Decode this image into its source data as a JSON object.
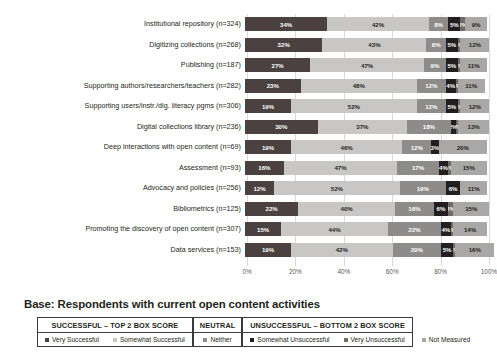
{
  "base_note": "Base: Respondents with current open content activities",
  "colors": {
    "very_successful": "#4a4140",
    "somewhat_successful": "#c8c7c5",
    "neither": "#8d8c8a",
    "somewhat_unsuccessful": "#231f20",
    "very_unsuccessful": "#6e6c6a",
    "not_measured": "#a9a8a6"
  },
  "legend": {
    "groups": [
      {
        "header": "SUCCESSFUL – TOP 2 BOX SCORE",
        "items": [
          {
            "label": "Very Successful",
            "color": "#4a4140"
          },
          {
            "label": "Somewhat Successful",
            "color": "#c8c7c5"
          }
        ]
      },
      {
        "header": "NEUTRAL",
        "items": [
          {
            "label": "Neither",
            "color": "#8d8c8a"
          }
        ]
      },
      {
        "header": "UNSUCCESSFUL – BOTTOM 2 BOX SCORE",
        "items": [
          {
            "label": "Somewhat Unsuccessful",
            "color": "#231f20"
          },
          {
            "label": "Very Unsuccessful",
            "color": "#6e6c6a"
          }
        ]
      }
    ],
    "loose": {
      "label": "Not Measured",
      "color": "#a9a8a6"
    }
  },
  "chart_data": {
    "type": "bar",
    "orientation": "horizontal",
    "stacked": true,
    "stack_total": 100,
    "title": "",
    "xlabel": "",
    "ylabel": "",
    "xlim": [
      0,
      100
    ],
    "xticks": [
      "0%",
      "20%",
      "40%",
      "60%",
      "80%",
      "100%"
    ],
    "xtick_values": [
      0,
      20,
      40,
      60,
      80,
      100
    ],
    "grid": true,
    "legend_position": "bottom",
    "series": [
      {
        "name": "Very Successful",
        "color": "#4a4140",
        "values": [
          34,
          32,
          27,
          23,
          19,
          30,
          19,
          16,
          12,
          22,
          15,
          19
        ]
      },
      {
        "name": "Somewhat Successful",
        "color": "#c8c7c5",
        "values": [
          42,
          43,
          47,
          48,
          52,
          37,
          46,
          47,
          52,
          40,
          44,
          42
        ]
      },
      {
        "name": "Neither",
        "color": "#8d8c8a",
        "values": [
          8,
          8,
          9,
          12,
          12,
          18,
          12,
          17,
          19,
          16,
          22,
          20
        ]
      },
      {
        "name": "Somewhat Unsuccessful",
        "color": "#231f20",
        "values": [
          5,
          5,
          5,
          4,
          5,
          2,
          3,
          4,
          6,
          6,
          4,
          5
        ]
      },
      {
        "name": "Very Unsuccessful",
        "color": "#6e6c6a",
        "values": [
          2,
          1,
          1,
          1,
          1,
          1,
          0,
          1,
          0,
          2,
          1,
          1
        ]
      },
      {
        "name": "Not Measured",
        "color": "#a9a8a6",
        "values": [
          9,
          12,
          11,
          11,
          12,
          13,
          20,
          15,
          11,
          15,
          14,
          16
        ]
      }
    ],
    "categories": [
      "Institutional repository (n=324)",
      "Digitizing collections (n=268)",
      "Publishing (n=187)",
      "Supporting authors/researchers/teachers (n=282)",
      "Supporting users/instr./dig. literacy pgms (n=306)",
      "Digital collections library (n=236)",
      "Deep interactions with open content (n=69)",
      "Assessment (n=93)",
      "Advocacy and policies (n=256)",
      "Bibliometrics (n=125)",
      "Promoting the discovery of open content (n=307)",
      "Data services (n=153)"
    ],
    "rows": [
      {
        "label": "Institutional repository (n=324)",
        "segments": [
          {
            "key": "very_successful",
            "label": "34%",
            "value": 34
          },
          {
            "key": "somewhat_successful",
            "label": "42%",
            "value": 42
          },
          {
            "key": "neither",
            "label": "8%",
            "value": 8
          },
          {
            "key": "somewhat_unsuccessful",
            "label": "5%",
            "value": 5
          },
          {
            "key": "very_unsuccessful",
            "label": "2%",
            "value": 2
          },
          {
            "key": "not_measured",
            "label": "9%",
            "value": 9
          }
        ]
      },
      {
        "label": "Digitizing collections (n=268)",
        "segments": [
          {
            "key": "very_successful",
            "label": "32%",
            "value": 32
          },
          {
            "key": "somewhat_successful",
            "label": "43%",
            "value": 43
          },
          {
            "key": "neither",
            "label": "8%",
            "value": 8
          },
          {
            "key": "somewhat_unsuccessful",
            "label": "5%",
            "value": 5
          },
          {
            "key": "very_unsuccessful",
            "label": "1%",
            "value": 1
          },
          {
            "key": "not_measured",
            "label": "12%",
            "value": 12
          }
        ]
      },
      {
        "label": "Publishing (n=187)",
        "segments": [
          {
            "key": "very_successful",
            "label": "27%",
            "value": 27
          },
          {
            "key": "somewhat_successful",
            "label": "47%",
            "value": 47
          },
          {
            "key": "neither",
            "label": "9%",
            "value": 9
          },
          {
            "key": "somewhat_unsuccessful",
            "label": "5%",
            "value": 5
          },
          {
            "key": "very_unsuccessful",
            "label": "1%",
            "value": 1
          },
          {
            "key": "not_measured",
            "label": "11%",
            "value": 11
          }
        ]
      },
      {
        "label": "Supporting authors/researchers/teachers (n=282)",
        "segments": [
          {
            "key": "very_successful",
            "label": "23%",
            "value": 23
          },
          {
            "key": "somewhat_successful",
            "label": "48%",
            "value": 48
          },
          {
            "key": "neither",
            "label": "12%",
            "value": 12
          },
          {
            "key": "somewhat_unsuccessful",
            "label": "4%",
            "value": 4
          },
          {
            "key": "very_unsuccessful",
            "label": "1%",
            "value": 1
          },
          {
            "key": "not_measured",
            "label": "11%",
            "value": 11
          }
        ]
      },
      {
        "label": "Supporting users/instr./dig. literacy pgms (n=306)",
        "segments": [
          {
            "key": "very_successful",
            "label": "19%",
            "value": 19
          },
          {
            "key": "somewhat_successful",
            "label": "52%",
            "value": 52
          },
          {
            "key": "neither",
            "label": "12%",
            "value": 12
          },
          {
            "key": "somewhat_unsuccessful",
            "label": "5%",
            "value": 5
          },
          {
            "key": "very_unsuccessful",
            "label": "1%",
            "value": 1
          },
          {
            "key": "not_measured",
            "label": "12%",
            "value": 12
          }
        ]
      },
      {
        "label": "Digital collections library (n=236)",
        "segments": [
          {
            "key": "very_successful",
            "label": "30%",
            "value": 30
          },
          {
            "key": "somewhat_successful",
            "label": "37%",
            "value": 37
          },
          {
            "key": "neither",
            "label": "18%",
            "value": 18
          },
          {
            "key": "somewhat_unsuccessful",
            "label": "2%",
            "value": 2
          },
          {
            "key": "very_unsuccessful",
            "label": "1%",
            "value": 1
          },
          {
            "key": "not_measured",
            "label": "13%",
            "value": 13
          }
        ]
      },
      {
        "label": "Deep interactions with open content (n=69)",
        "segments": [
          {
            "key": "very_successful",
            "label": "19%",
            "value": 19
          },
          {
            "key": "somewhat_successful",
            "label": "46%",
            "value": 46
          },
          {
            "key": "neither",
            "label": "12%",
            "value": 12
          },
          {
            "key": "somewhat_unsuccessful",
            "label": "3%",
            "value": 3
          },
          {
            "key": "very_unsuccessful",
            "label": "0%",
            "value": 0
          },
          {
            "key": "not_measured",
            "label": "20%",
            "value": 20
          }
        ]
      },
      {
        "label": "Assessment (n=93)",
        "segments": [
          {
            "key": "very_successful",
            "label": "16%",
            "value": 16
          },
          {
            "key": "somewhat_successful",
            "label": "47%",
            "value": 47
          },
          {
            "key": "neither",
            "label": "17%",
            "value": 17
          },
          {
            "key": "somewhat_unsuccessful",
            "label": "4%",
            "value": 4
          },
          {
            "key": "very_unsuccessful",
            "label": "1%",
            "value": 1
          },
          {
            "key": "not_measured",
            "label": "15%",
            "value": 15
          }
        ]
      },
      {
        "label": "Advocacy and policies (n=256)",
        "segments": [
          {
            "key": "very_successful",
            "label": "12%",
            "value": 12
          },
          {
            "key": "somewhat_successful",
            "label": "52%",
            "value": 52
          },
          {
            "key": "neither",
            "label": "19%",
            "value": 19
          },
          {
            "key": "somewhat_unsuccessful",
            "label": "6%",
            "value": 6
          },
          {
            "key": "very_unsuccessful",
            "label": "0%",
            "value": 0
          },
          {
            "key": "not_measured",
            "label": "11%",
            "value": 11
          }
        ]
      },
      {
        "label": "Bibliometrics (n=125)",
        "segments": [
          {
            "key": "very_successful",
            "label": "22%",
            "value": 22
          },
          {
            "key": "somewhat_successful",
            "label": "40%",
            "value": 40
          },
          {
            "key": "neither",
            "label": "16%",
            "value": 16
          },
          {
            "key": "somewhat_unsuccessful",
            "label": "6%",
            "value": 6
          },
          {
            "key": "very_unsuccessful",
            "label": "2%",
            "value": 2
          },
          {
            "key": "not_measured",
            "label": "15%",
            "value": 15
          }
        ]
      },
      {
        "label": "Promoting the discovery of open content (n=307)",
        "segments": [
          {
            "key": "very_successful",
            "label": "15%",
            "value": 15
          },
          {
            "key": "somewhat_successful",
            "label": "44%",
            "value": 44
          },
          {
            "key": "neither",
            "label": "22%",
            "value": 22
          },
          {
            "key": "somewhat_unsuccessful",
            "label": "4%",
            "value": 4
          },
          {
            "key": "very_unsuccessful",
            "label": "1%",
            "value": 1
          },
          {
            "key": "not_measured",
            "label": "14%",
            "value": 14
          }
        ]
      },
      {
        "label": "Data services (n=153)",
        "segments": [
          {
            "key": "very_successful",
            "label": "19%",
            "value": 19
          },
          {
            "key": "somewhat_successful",
            "label": "42%",
            "value": 42
          },
          {
            "key": "neither",
            "label": "20%",
            "value": 20
          },
          {
            "key": "somewhat_unsuccessful",
            "label": "5%",
            "value": 5
          },
          {
            "key": "very_unsuccessful",
            "label": "1%",
            "value": 1
          },
          {
            "key": "not_measured",
            "label": "16%",
            "value": 16
          }
        ]
      }
    ]
  }
}
